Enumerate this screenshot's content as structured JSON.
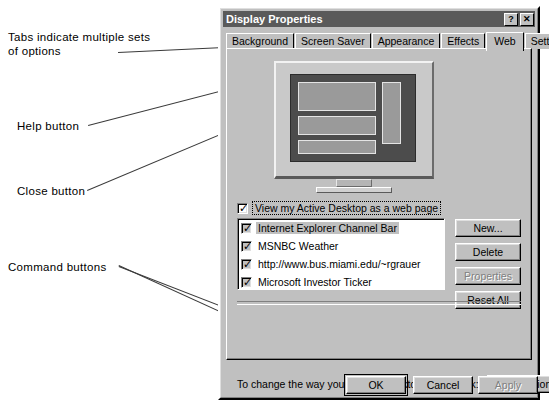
{
  "annotations": [
    {
      "id": "tabs",
      "text": "Tabs indicate multiple sets\nof options"
    },
    {
      "id": "help",
      "text": "Help button"
    },
    {
      "id": "close",
      "text": "Close button"
    },
    {
      "id": "commands",
      "text": "Command buttons"
    }
  ],
  "dialog": {
    "title": "Display Properties",
    "titlebar_buttons": [
      {
        "name": "help-button",
        "glyph": "?"
      },
      {
        "name": "close-button",
        "glyph": "✕"
      }
    ],
    "tabs": [
      {
        "label": "Background",
        "selected": false
      },
      {
        "label": "Screen Saver",
        "selected": false
      },
      {
        "label": "Appearance",
        "selected": false
      },
      {
        "label": "Effects",
        "selected": false
      },
      {
        "label": "Web",
        "selected": true
      },
      {
        "label": "Settings",
        "selected": false
      }
    ],
    "view_checkbox": {
      "label": "View my Active Desktop as a web page",
      "checked": true
    },
    "items": [
      {
        "label": "Internet Explorer Channel Bar",
        "checked": true,
        "selected": true
      },
      {
        "label": "MSNBC Weather",
        "checked": true,
        "selected": false
      },
      {
        "label": "http://www.bus.miami.edu/~rgrauer",
        "checked": true,
        "selected": false
      },
      {
        "label": "Microsoft Investor Ticker",
        "checked": true,
        "selected": false
      }
    ],
    "side_buttons": [
      {
        "label": "New...",
        "enabled": true
      },
      {
        "label": "Delete",
        "enabled": true
      },
      {
        "label": "Properties",
        "enabled": false
      },
      {
        "label": "Reset All",
        "enabled": true
      }
    ],
    "folder_row": {
      "text": "To change the way you click on desktop icons, click:",
      "button": "Folder Options"
    },
    "bottom_buttons": [
      {
        "label": "OK",
        "enabled": true,
        "default": true
      },
      {
        "label": "Cancel",
        "enabled": true,
        "default": false
      },
      {
        "label": "Apply",
        "enabled": false,
        "default": false
      }
    ]
  },
  "colors": {
    "face": "#c0c0c0",
    "titlebar": "#5a5a5a",
    "titlebar_text": "#ffffff",
    "screen": "#4c4c4c",
    "disabled_text": "#808080",
    "annotation_text": "#000000"
  }
}
